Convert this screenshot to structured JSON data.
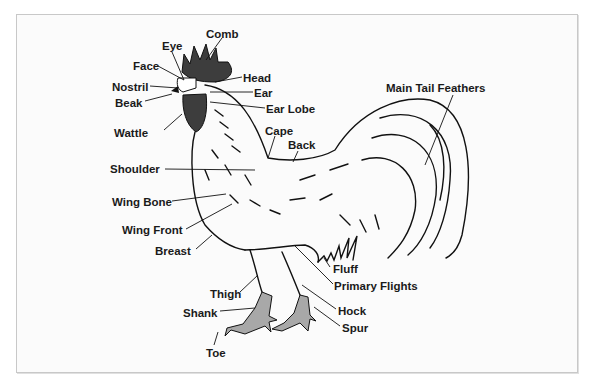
{
  "diagram": {
    "colors": {
      "comb": "#3d3d3d",
      "legs": "#a8a8a8",
      "outline": "#111111",
      "text": "#1a1a1a"
    },
    "labels": [
      {
        "id": "comb",
        "text": "Comb",
        "x": 206,
        "y": 28
      },
      {
        "id": "eye",
        "text": "Eye",
        "x": 162,
        "y": 40
      },
      {
        "id": "face",
        "text": "Face",
        "x": 133,
        "y": 60
      },
      {
        "id": "head",
        "text": "Head",
        "x": 243,
        "y": 72
      },
      {
        "id": "nostril",
        "text": "Nostril",
        "x": 112,
        "y": 81
      },
      {
        "id": "ear",
        "text": "Ear",
        "x": 254,
        "y": 87
      },
      {
        "id": "beak",
        "text": "Beak",
        "x": 115,
        "y": 97
      },
      {
        "id": "ear-lobe",
        "text": "Ear Lobe",
        "x": 266,
        "y": 103
      },
      {
        "id": "main-tail-feathers",
        "text": "Main Tail Feathers",
        "x": 386,
        "y": 82
      },
      {
        "id": "wattle",
        "text": "Wattle",
        "x": 114,
        "y": 127
      },
      {
        "id": "cape",
        "text": "Cape",
        "x": 265,
        "y": 125
      },
      {
        "id": "back",
        "text": "Back",
        "x": 288,
        "y": 139
      },
      {
        "id": "shoulder",
        "text": "Shoulder",
        "x": 110,
        "y": 163
      },
      {
        "id": "wing-bone",
        "text": "Wing Bone",
        "x": 112,
        "y": 196
      },
      {
        "id": "wing-front",
        "text": "Wing Front",
        "x": 122,
        "y": 224
      },
      {
        "id": "breast",
        "text": "Breast",
        "x": 155,
        "y": 245
      },
      {
        "id": "fluff",
        "text": "Fluff",
        "x": 333,
        "y": 263
      },
      {
        "id": "primary-flights",
        "text": "Primary Flights",
        "x": 334,
        "y": 280
      },
      {
        "id": "thigh",
        "text": "Thigh",
        "x": 210,
        "y": 288
      },
      {
        "id": "shank",
        "text": "Shank",
        "x": 183,
        "y": 307
      },
      {
        "id": "hock",
        "text": "Hock",
        "x": 338,
        "y": 305
      },
      {
        "id": "spur",
        "text": "Spur",
        "x": 342,
        "y": 322
      },
      {
        "id": "toe",
        "text": "Toe",
        "x": 206,
        "y": 347
      }
    ]
  }
}
